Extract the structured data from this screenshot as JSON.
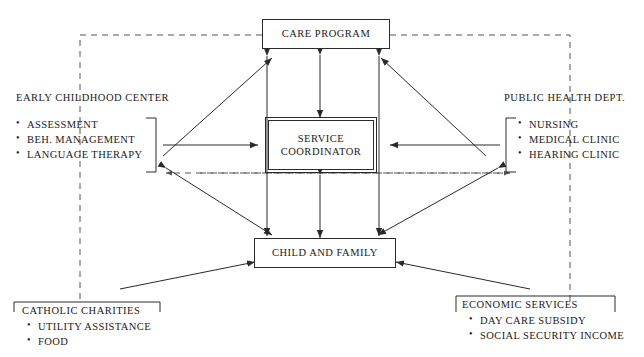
{
  "diagram": {
    "nodes": {
      "care_program": "CARE PROGRAM",
      "service_coordinator_line1": "SERVICE",
      "service_coordinator_line2": "COORDINATOR",
      "child_and_family": "CHILD AND FAMILY"
    },
    "groups": {
      "early_childhood": {
        "header": "EARLY CHILDHOOD CENTER",
        "items": [
          "ASSESSMENT",
          "BEH. MANAGEMENT",
          "LANGUAGE THERAPY"
        ]
      },
      "public_health": {
        "header": "PUBLIC HEALTH DEPT.",
        "items": [
          "NURSING",
          "MEDICAL CLINIC",
          "HEARING CLINIC"
        ]
      },
      "catholic_charities": {
        "header": "CATHOLIC CHARITIES",
        "items": [
          "UTILITY ASSISTANCE",
          "FOOD"
        ]
      },
      "economic_services": {
        "header": "ECONOMIC SERVICES",
        "items": [
          "DAY CARE SUBSIDY",
          "SOCIAL SECURITY INCOME"
        ]
      }
    },
    "colors": {
      "ink": "#2a2a2a",
      "text": "#1a1a1a",
      "background": "#ffffff"
    }
  }
}
